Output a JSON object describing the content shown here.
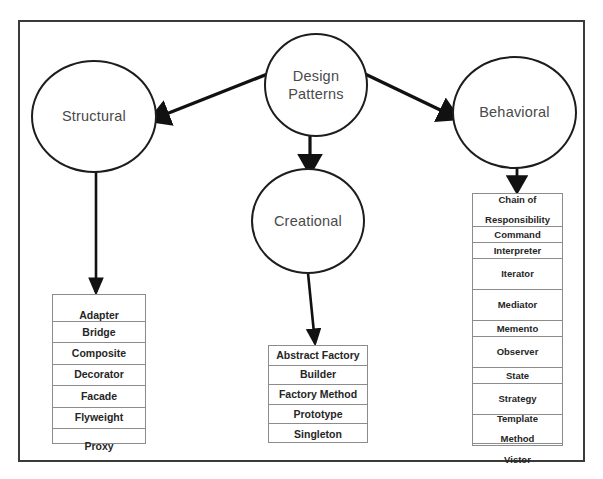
{
  "diagram": {
    "root": {
      "label": "Design\nPatterns",
      "line1": "Design",
      "line2": "Patterns"
    },
    "categories": [
      {
        "id": "structural",
        "label": "Structural"
      },
      {
        "id": "creational",
        "label": "Creational"
      },
      {
        "id": "behavioral",
        "label": "Behavioral"
      }
    ],
    "lists": {
      "structural": [
        "Adapter",
        "Bridge",
        "Composite",
        "Decorator",
        "Facade",
        "Flyweight",
        "Proxy"
      ],
      "creational": [
        "Abstract Factory",
        "Builder",
        "Factory Method",
        "Prototype",
        "Singleton"
      ],
      "behavioral": [
        "Chain of Responsibility",
        "Command",
        "Interpreter",
        "Iterator",
        "Mediator",
        "Memento",
        "Observer",
        "State",
        "Strategy",
        "Template Method",
        "Vistor"
      ]
    },
    "behavioral_rows": [
      {
        "line1": "Chain of",
        "line2": "Responsibility"
      },
      {
        "line1": "Command",
        "line2": ""
      },
      {
        "line1": "Interpreter",
        "line2": ""
      },
      {
        "line1": "Iterator",
        "line2": ""
      },
      {
        "line1": "Mediator",
        "line2": ""
      },
      {
        "line1": "Memento",
        "line2": ""
      },
      {
        "line1": "Observer",
        "line2": ""
      },
      {
        "line1": "State",
        "line2": ""
      },
      {
        "line1": "Strategy",
        "line2": ""
      },
      {
        "line1": "Template",
        "line2": "Method"
      },
      {
        "line1": "Vistor",
        "line2": ""
      }
    ],
    "colors": {
      "frame": "#3a3a3a",
      "circle_stroke": "#1d1d1d",
      "circle_text": "#4a4a4a",
      "box_stroke": "#8c8c8c",
      "box_text": "#262626",
      "arrow": "#111111",
      "background": "#ffffff"
    }
  }
}
